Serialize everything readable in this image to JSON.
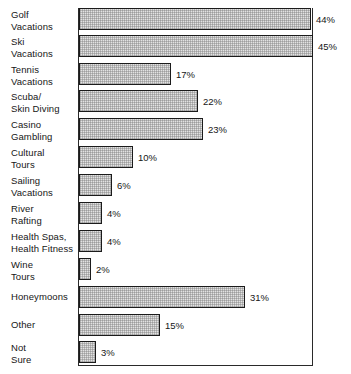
{
  "chart_data": {
    "type": "bar",
    "orientation": "horizontal",
    "title": "",
    "xlabel": "",
    "ylabel": "",
    "xlim": [
      0,
      45
    ],
    "grid": false,
    "legend": null,
    "value_suffix": "%",
    "categories": [
      "Golf\nVacations",
      "Ski\nVacations",
      "Tennis\nVacations",
      "Scuba/\nSkin Diving",
      "Casino\nGambling",
      "Cultural\nTours",
      "Sailing\nVacations",
      "River\nRafting",
      "Health Spas,\nHealth Fitness",
      "Wine\nTours",
      "Honeymoons",
      "Other",
      "Not\nSure"
    ],
    "values": [
      44,
      45,
      17,
      22,
      23,
      10,
      6,
      4,
      4,
      2,
      31,
      15,
      3
    ],
    "value_labels": [
      "44%",
      "45%",
      "17%",
      "22%",
      "23%",
      "10%",
      "6%",
      "4%",
      "4%",
      "2%",
      "31%",
      "15%",
      "3%"
    ],
    "colors": {
      "bar_fill": "#e2e2e2",
      "bar_border": "#1b1b1b",
      "axis": "#2a2a2a",
      "text": "#161616",
      "background": "#ffffff"
    }
  },
  "bars": [
    {
      "label": "Golf\nVacations",
      "value_label": "44%",
      "top": 8,
      "height": 22,
      "width": 232,
      "label_top": 9,
      "value_top": 14
    },
    {
      "label": "Ski\nVacations",
      "value_label": "45%",
      "top": 35,
      "height": 22,
      "width": 234,
      "label_top": 36,
      "value_top": 41
    },
    {
      "label": "Tennis\nVacations",
      "value_label": "17%",
      "top": 63,
      "height": 22,
      "width": 92,
      "label_top": 64,
      "value_top": 69
    },
    {
      "label": "Scuba/\nSkin Diving",
      "value_label": "22%",
      "top": 90,
      "height": 22,
      "width": 119,
      "label_top": 91,
      "value_top": 96
    },
    {
      "label": "Casino\nGambling",
      "value_label": "23%",
      "top": 118,
      "height": 22,
      "width": 124,
      "label_top": 119,
      "value_top": 124
    },
    {
      "label": "Cultural\nTours",
      "value_label": "10%",
      "top": 146,
      "height": 22,
      "width": 54,
      "label_top": 147,
      "value_top": 152
    },
    {
      "label": "Sailing\nVacations",
      "value_label": "6%",
      "top": 174,
      "height": 22,
      "width": 33,
      "label_top": 175,
      "value_top": 180
    },
    {
      "label": "River\nRafting",
      "value_label": "4%",
      "top": 202,
      "height": 22,
      "width": 23,
      "label_top": 203,
      "value_top": 208
    },
    {
      "label": "Health Spas,\nHealth Fitness",
      "value_label": "4%",
      "top": 230,
      "height": 22,
      "width": 23,
      "label_top": 231,
      "value_top": 236
    },
    {
      "label": "Wine\nTours",
      "value_label": "2%",
      "top": 258,
      "height": 22,
      "width": 12,
      "label_top": 259,
      "value_top": 264
    },
    {
      "label": "Honeymoons",
      "value_label": "31%",
      "top": 286,
      "height": 22,
      "width": 166,
      "label_top": 291,
      "value_top": 292
    },
    {
      "label": "Other",
      "value_label": "15%",
      "top": 314,
      "height": 22,
      "width": 81,
      "label_top": 319,
      "value_top": 320
    },
    {
      "label": "Not\nSure",
      "value_label": "3%",
      "top": 341,
      "height": 22,
      "width": 17,
      "label_top": 342,
      "value_top": 347
    }
  ]
}
